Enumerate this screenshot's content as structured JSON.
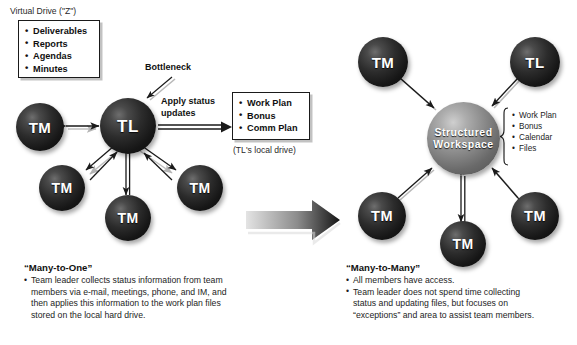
{
  "left": {
    "virtual_drive_label": "Virtual Drive (\"Z\")",
    "virtual_drive_items": [
      "Deliverables",
      "Reports",
      "Agendas",
      "Minutes"
    ],
    "bottleneck_label": "Bottleneck",
    "apply_label_line1": "Apply status",
    "apply_label_line2": "updates",
    "local_drive_items": [
      "Work Plan",
      "Bonus",
      "Comm Plan"
    ],
    "local_drive_caption": "(TL's local drive)",
    "nodes": [
      {
        "id": "tl",
        "label": "TL"
      },
      {
        "id": "tm-left",
        "label": "TM"
      },
      {
        "id": "tm-lower-left",
        "label": "TM"
      },
      {
        "id": "tm-bottom",
        "label": "TM"
      },
      {
        "id": "tm-lower-right",
        "label": "TM"
      }
    ],
    "footer": {
      "title": "“Many-to-One”",
      "bullets": [
        [
          "Team leader collects status information from team",
          "members via e-mail, meetings, phone, and IM, and",
          "then applies this information to the work plan files",
          "stored on the local hard drive."
        ]
      ]
    }
  },
  "right": {
    "center_label_line1": "Structured",
    "center_label_line2": "Workspace",
    "brace_items": [
      "Work Plan",
      "Bonus",
      "Calendar",
      "Files"
    ],
    "nodes": [
      {
        "id": "tm-top-left",
        "label": "TM"
      },
      {
        "id": "tl-top-right",
        "label": "TL"
      },
      {
        "id": "tm-lower-left",
        "label": "TM"
      },
      {
        "id": "tm-bottom",
        "label": "TM"
      },
      {
        "id": "tm-lower-right",
        "label": "TM"
      }
    ],
    "footer": {
      "title": "“Many-to-Many”",
      "bullets": [
        [
          "All members have access."
        ],
        [
          "Team leader does not spend time collecting",
          "status and updating files, but focuses on",
          "“exceptions” and area to assist team members."
        ]
      ]
    }
  },
  "transition": {
    "arrow_name": "transition-arrow"
  },
  "colors": {
    "sphere_dark": "#1c1c1c",
    "sphere_light": "#8d8d8d",
    "line": "#1a1a1a",
    "background": "#ffffff"
  }
}
